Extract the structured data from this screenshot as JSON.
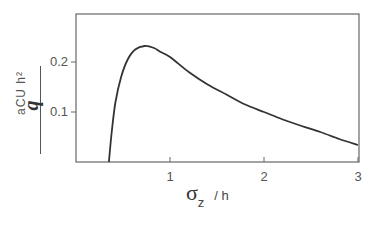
{
  "chart_data": {
    "type": "line",
    "title": "",
    "xlabel": "σ_z / h",
    "ylabel": "aCU h² / q",
    "xlim": [
      0,
      3
    ],
    "ylim": [
      0,
      0.3
    ],
    "xticks": [
      "1",
      "2",
      "3"
    ],
    "yticks": [
      "0.1",
      "0.2"
    ],
    "grid": false,
    "legend": null,
    "series": [
      {
        "name": "aCUh²/q",
        "x": [
          0.35,
          0.38,
          0.42,
          0.48,
          0.55,
          0.63,
          0.73,
          0.83,
          0.9,
          1.0,
          1.2,
          1.4,
          1.6,
          1.8,
          2.0,
          2.2,
          2.4,
          2.6,
          2.8,
          3.0
        ],
        "y": [
          0.0,
          0.06,
          0.12,
          0.17,
          0.205,
          0.225,
          0.232,
          0.228,
          0.22,
          0.21,
          0.18,
          0.155,
          0.135,
          0.115,
          0.1,
          0.085,
          0.072,
          0.06,
          0.046,
          0.034
        ]
      }
    ]
  },
  "axes": {
    "x_label_symbol": "σ",
    "x_label_sub": "z",
    "x_label_rest": "/ h",
    "y_label_numerator": "aCU h²",
    "y_label_denominator": "q"
  }
}
